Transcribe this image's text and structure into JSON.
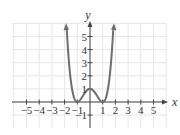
{
  "chart_data": {
    "type": "line",
    "title": "",
    "function": "y = (x^2 - 1)^2",
    "xlabel": "x",
    "ylabel": "y",
    "xlim": [
      -5.5,
      6
    ],
    "ylim": [
      -2,
      6
    ],
    "x_ticks": [
      -5,
      -4,
      -3,
      -2,
      -1,
      1,
      2,
      3,
      4,
      5
    ],
    "x_tick_labels": [
      "−5",
      "−4",
      "−3",
      "−2",
      "−1",
      "1",
      "2",
      "3",
      "4",
      "5"
    ],
    "y_ticks": [
      -1,
      1,
      2,
      3,
      4,
      5
    ],
    "y_tick_labels": [
      "−1",
      "1",
      "2",
      "3",
      "4",
      "5"
    ],
    "grid": true,
    "legend": null,
    "series": [
      {
        "name": "curve",
        "x": [
          -1.9,
          -1.75,
          -1.5,
          -1.25,
          -1.0,
          -0.75,
          -0.5,
          -0.25,
          0,
          0.25,
          0.5,
          0.75,
          1.0,
          1.25,
          1.5,
          1.75,
          1.9
        ],
        "y": [
          6.86,
          4.26,
          1.56,
          0.32,
          0,
          0.19,
          0.56,
          0.88,
          1,
          0.88,
          0.56,
          0.19,
          0,
          0.32,
          1.56,
          4.26,
          6.86
        ],
        "arrows_at_ends": true
      }
    ],
    "key_points": [
      {
        "x": -1,
        "y": 0
      },
      {
        "x": 0,
        "y": 1
      },
      {
        "x": 1,
        "y": 0
      }
    ]
  },
  "colors": {
    "curve": "#6e6e6e",
    "axis": "#444444",
    "grid": "#e6e6e6",
    "text": "#333333"
  }
}
